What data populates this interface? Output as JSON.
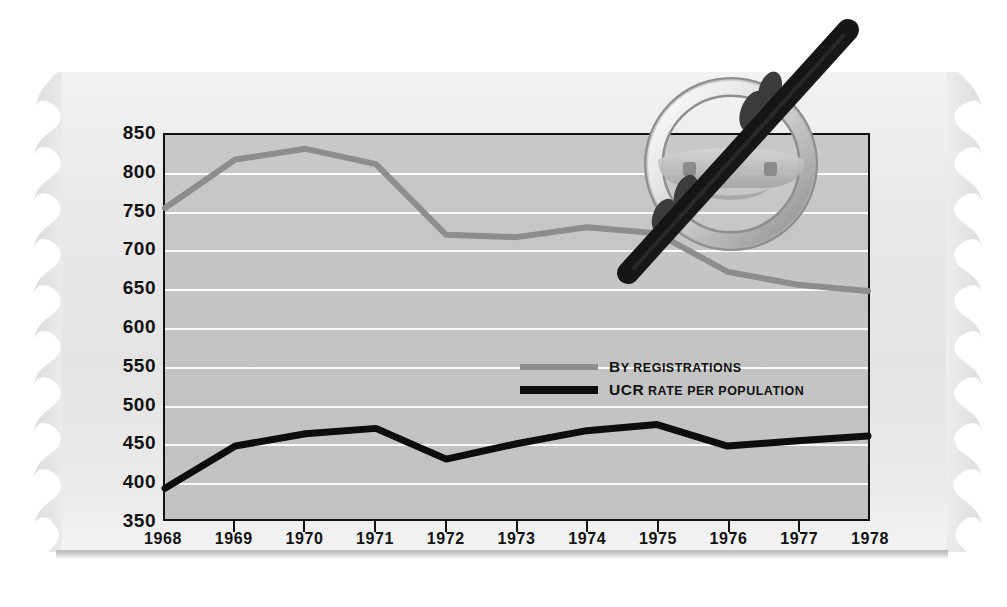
{
  "chart_data": {
    "type": "line",
    "title": "",
    "xlabel": "",
    "ylabel": "",
    "ylim": [
      350,
      850
    ],
    "ytick_step": 50,
    "grid": true,
    "legend_position": "inside-right-middle",
    "categories": [
      "1968",
      "1969",
      "1970",
      "1971",
      "1972",
      "1973",
      "1974",
      "1975",
      "1976",
      "1977",
      "1978"
    ],
    "yticks": [
      "850",
      "800",
      "750",
      "700",
      "650",
      "600",
      "550",
      "500",
      "450",
      "400",
      "350"
    ],
    "series": [
      {
        "name": "By registrations",
        "color": "#8d8d8d",
        "values": [
          755,
          818,
          832,
          812,
          720,
          717,
          730,
          722,
          672,
          655,
          647
        ]
      },
      {
        "name": "UCR rate per population",
        "color": "#0d0d0d",
        "values": [
          390,
          445,
          461,
          468,
          428,
          448,
          465,
          473,
          445,
          452,
          458
        ]
      }
    ]
  },
  "legend": {
    "items": [
      {
        "label_lead": "B",
        "label_rest": "Y REGISTRATIONS",
        "swatch": "gray"
      },
      {
        "label_lead": "UCR",
        "label_rest": " RATE PER POPULATION",
        "swatch": "black"
      }
    ]
  },
  "artwork": {
    "steering_wheel": "steering-wheel-icon",
    "slash": "diagonal-slash-bar"
  },
  "colors": {
    "page_background": "#ffffff",
    "paper": "#e9e9e9",
    "plot_background": "#c4c4c4",
    "gridline": "#fbfbfb",
    "axis": "#111111",
    "series_gray": "#8d8d8d",
    "series_black": "#0d0d0d"
  }
}
